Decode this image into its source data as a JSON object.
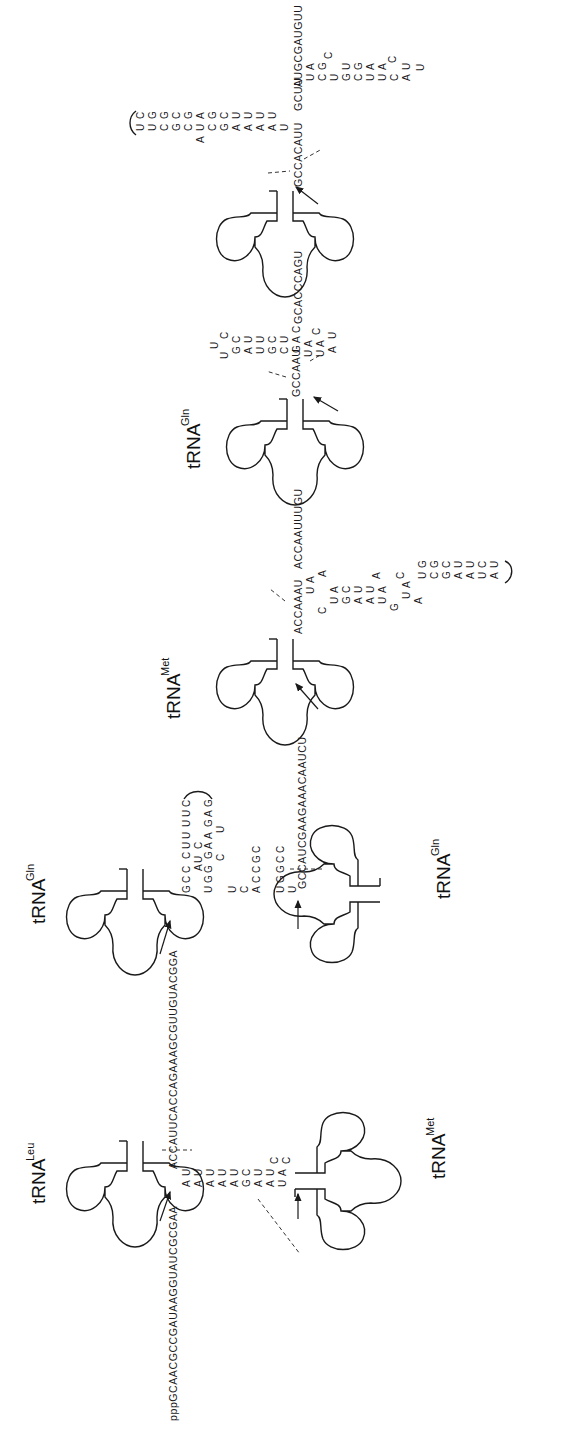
{
  "figure": {
    "orientation": "rotated-90-ccw",
    "labels": {
      "trna_leu": {
        "base": "tRNA",
        "sup": "Leu"
      },
      "trna_gln_1": {
        "base": "tRNA",
        "sup": "Gln"
      },
      "trna_met_1": {
        "base": "tRNA",
        "sup": "Met"
      },
      "trna_gln_2": {
        "base": "tRNA",
        "sup": "Gln"
      },
      "trna_met_2": {
        "base": "tRNA",
        "sup": "Met"
      },
      "trna_gln_3": {
        "base": "tRNA",
        "sup": "Gln"
      }
    },
    "sequences": {
      "leader_5prime": "pppGCAACGCCGAUAAGGUAUCGCGAA",
      "leu_trailer_spacer": "ACCAUUCACCAGAAAGCGUUGUACGGA",
      "gln1_3prime": "GCC",
      "gln1_spacer_top": "AU",
      "gln1_spacer_loop_c": "C",
      "gln1_hairpin_top": [
        "CUU",
        "UUC"
      ],
      "gln1_hairpin_bottom": [
        "GAA",
        "GAG"
      ],
      "gln1_stem_left": [
        "UGG",
        "U",
        "C",
        "ACCGC",
        "UGGCC",
        "U",
        "A",
        "U"
      ],
      "gln1_bulge": [
        "C",
        "U"
      ],
      "met1_spacer": "GCCAUCGAAGAAACAAUCU",
      "met2_trailer": "ACCAAAU",
      "met2_spacer_after_stem": "ACCAAUUUGU",
      "gln3_trailer": "GCCAAU",
      "gln3_spacer": "GAC",
      "gln3_after_stem": "GCACCCAGU",
      "final_trailer": "GCCACAUU",
      "final_after_stem": "GCUU",
      "final_3prime": "AUGCGAUGUU"
    },
    "stem_leu_met": {
      "left": [
        "A",
        "A",
        "A",
        "A",
        "A",
        "G",
        "A",
        "A",
        "U"
      ],
      "right": [
        "U",
        "U",
        "U",
        "U",
        "U",
        "C",
        "U",
        "U",
        "A"
      ],
      "loop": [
        "A",
        "C",
        "C"
      ]
    },
    "stem_met_gln": {
      "pairs_left": [
        "U",
        "C",
        "G",
        "A",
        "A",
        "U",
        "G",
        "U",
        "A",
        "U",
        "C",
        "G",
        "A",
        "A",
        "U",
        "A"
      ],
      "pairs_right": [
        "A",
        "A",
        "C",
        "U",
        "U",
        "A",
        "A",
        "C",
        "A",
        "G",
        "G",
        "C",
        "U",
        "U",
        "C",
        "U"
      ]
    },
    "stem_gln_mid": {
      "left": [
        "C",
        "C",
        "A",
        "U",
        "U",
        "C",
        "G",
        "U"
      ],
      "right": [
        "U",
        "G",
        "U",
        "A",
        "A",
        "G",
        "U"
      ]
    },
    "stem_final_left": {
      "left": [
        "U",
        "U",
        "C",
        "G",
        "C",
        "U",
        "C",
        "G",
        "A",
        "A",
        "A",
        "A"
      ],
      "right": [
        "C",
        "G",
        "G",
        "C",
        "G",
        "A",
        "G",
        "C",
        "U",
        "U",
        "U",
        "U"
      ],
      "bulge": "A"
    },
    "stem_final_right": {
      "left": [
        "U",
        "C",
        "U",
        "C",
        "U",
        "C",
        "A"
      ],
      "right": [
        "A",
        "G",
        "G",
        "G",
        "A",
        "A",
        "C"
      ],
      "loop": [
        "C",
        "U",
        "U"
      ]
    }
  }
}
